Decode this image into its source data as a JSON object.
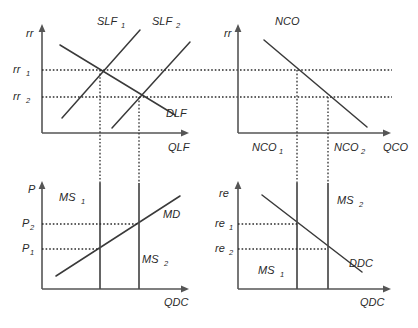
{
  "figure": {
    "background_color": "#ffffff",
    "line_color": "#3a3a3a",
    "axis_color": "#555555",
    "guide_color": "#2b2b2b"
  },
  "panels": [
    {
      "id": "loanable-funds",
      "name": "Market for Loanable Funds",
      "y_axis_label": "rr",
      "x_axis_label": "QLF",
      "y_tick_labels": [
        "rr",
        "rr"
      ],
      "y_tick_subs": [
        "1",
        "2"
      ],
      "curves": [
        {
          "name": "SLF",
          "sub": "1",
          "type": "supply",
          "slope": "upward"
        },
        {
          "name": "SLF",
          "sub": "2",
          "type": "supply",
          "slope": "upward"
        },
        {
          "name": "DLF",
          "sub": "",
          "type": "demand",
          "slope": "downward"
        }
      ]
    },
    {
      "id": "net-capital-outflow",
      "name": "Net Capital Outflow",
      "y_axis_label": "rr",
      "x_axis_label": "QCO",
      "x_tick_labels": [
        "NCO",
        "NCO"
      ],
      "x_tick_subs": [
        "1",
        "2"
      ],
      "curves": [
        {
          "name": "NCO",
          "sub": "",
          "type": "outflow",
          "slope": "downward"
        }
      ]
    },
    {
      "id": "domestic-goods-market",
      "name": "Market for Domestic Currency Goods",
      "y_axis_label": "P",
      "x_axis_label": "QDC",
      "y_tick_labels": [
        "P",
        "P"
      ],
      "y_tick_subs": [
        "2",
        "1"
      ],
      "curves": [
        {
          "name": "MS",
          "sub": "1",
          "type": "supply",
          "slope": "vertical"
        },
        {
          "name": "MS",
          "sub": "2",
          "type": "supply",
          "slope": "vertical"
        },
        {
          "name": "MD",
          "sub": "",
          "type": "demand",
          "slope": "upward"
        }
      ]
    },
    {
      "id": "foreign-exchange-market",
      "name": "Foreign Exchange Market",
      "y_axis_label": "re",
      "x_axis_label": "QDC",
      "y_tick_labels": [
        "re",
        "re"
      ],
      "y_tick_subs": [
        "1",
        "2"
      ],
      "curves": [
        {
          "name": "MS",
          "sub": "1",
          "type": "supply",
          "slope": "vertical"
        },
        {
          "name": "MS",
          "sub": "2",
          "type": "supply",
          "slope": "vertical"
        },
        {
          "name": "DDC",
          "sub": "",
          "type": "demand",
          "slope": "downward"
        }
      ]
    }
  ],
  "labels": {
    "rr_p1": "rr",
    "rr1": "rr",
    "rr1_sub": "1",
    "rr2": "rr",
    "rr2_sub": "2",
    "slf1": "SLF",
    "slf1_sub": "1",
    "slf2": "SLF",
    "slf2_sub": "2",
    "dlf": "DLF",
    "qlf": "QLF",
    "rr_p2": "rr",
    "nco": "NCO",
    "nco1": "NCO",
    "nco1_sub": "1",
    "nco2": "NCO",
    "nco2_sub": "2",
    "qco": "QCO",
    "p_axis": "P",
    "p1": "P",
    "p1_sub": "1",
    "p2": "P",
    "p2_sub": "2",
    "ms1_p3": "MS",
    "ms1_p3_sub": "1",
    "ms2_p3": "MS",
    "ms2_p3_sub": "2",
    "md": "MD",
    "qdc_p3": "QDC",
    "re_axis": "re",
    "re1": "re",
    "re1_sub": "1",
    "re2": "re",
    "re2_sub": "2",
    "ms1_p4": "MS",
    "ms1_p4_sub": "1",
    "ms2_p4": "MS",
    "ms2_p4_sub": "2",
    "ddc": "DDC",
    "qdc_p4": "QDC"
  },
  "geometry": {
    "panel1": {
      "y_axis_x": 42,
      "x_axis_y": 133,
      "x_axis_end": 190,
      "y_axis_top": 26,
      "rr1_y": 70,
      "rr2_y": 97,
      "q1_x": 100,
      "q2_x": 139
    },
    "panel2": {
      "y_axis_x": 238,
      "x_axis_y": 133,
      "x_axis_end": 392,
      "y_axis_top": 26,
      "rr1_y": 70,
      "rr2_y": 97,
      "nco1_x": 297,
      "nco2_x": 328
    },
    "panel3": {
      "y_axis_x": 42,
      "x_axis_y": 289,
      "x_axis_end": 190,
      "y_axis_top": 183,
      "p2_y": 224,
      "p1_y": 249,
      "ms1_x": 100,
      "ms2_x": 139
    },
    "panel4": {
      "y_axis_x": 238,
      "x_axis_y": 289,
      "x_axis_end": 392,
      "y_axis_top": 183,
      "re1_y": 224,
      "re2_y": 249,
      "ms1_x": 297,
      "ms2_x": 328
    }
  }
}
